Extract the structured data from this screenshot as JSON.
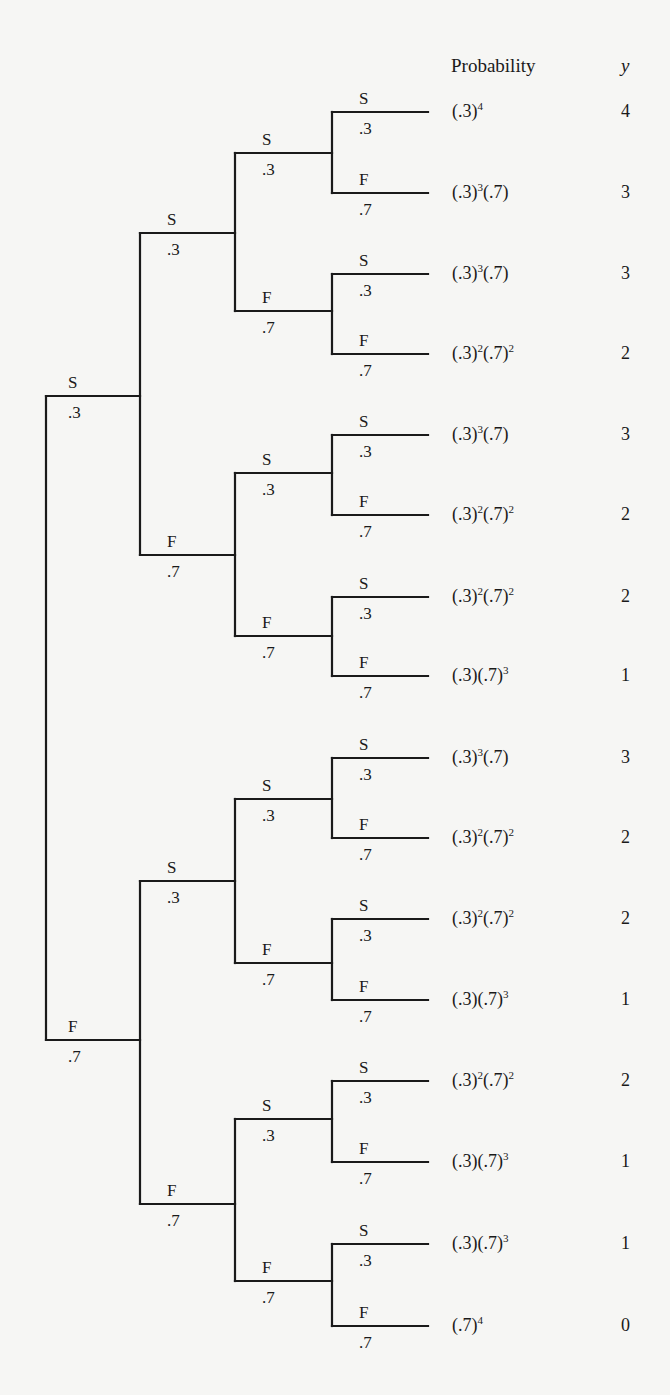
{
  "header": {
    "probability_label": "Probability",
    "y_label": "y"
  },
  "tree": {
    "root_x": 46,
    "level_x": [
      46,
      140,
      235,
      332,
      428
    ],
    "line_color": "#1a1a1a",
    "edge_prob_success": ".3",
    "edge_prob_failure": ".7",
    "outcome_success": "S",
    "outcome_failure": "F"
  },
  "nodes": {
    "level1": [
      {
        "outcome": "S",
        "prob": ".3",
        "y": 396
      },
      {
        "outcome": "F",
        "prob": ".7",
        "y": 1040
      }
    ],
    "level2": [
      {
        "outcome": "S",
        "prob": ".3",
        "y": 233
      },
      {
        "outcome": "F",
        "prob": ".7",
        "y": 555
      },
      {
        "outcome": "S",
        "prob": ".3",
        "y": 881
      },
      {
        "outcome": "F",
        "prob": ".7",
        "y": 1204
      }
    ],
    "level3": [
      {
        "outcome": "S",
        "prob": ".3",
        "y": 153
      },
      {
        "outcome": "F",
        "prob": ".7",
        "y": 311
      },
      {
        "outcome": "S",
        "prob": ".3",
        "y": 473
      },
      {
        "outcome": "F",
        "prob": ".7",
        "y": 636
      },
      {
        "outcome": "S",
        "prob": ".3",
        "y": 799
      },
      {
        "outcome": "F",
        "prob": ".7",
        "y": 963
      },
      {
        "outcome": "S",
        "prob": ".3",
        "y": 1119
      },
      {
        "outcome": "F",
        "prob": ".7",
        "y": 1281
      }
    ]
  },
  "leaves": [
    {
      "outcome": "S",
      "prob": ".3",
      "y": 112,
      "probability": [
        [
          "(.3)",
          "4"
        ]
      ],
      "y_value": "4"
    },
    {
      "outcome": "F",
      "prob": ".7",
      "y": 193,
      "probability": [
        [
          "(.3)",
          "3"
        ],
        [
          "(.7)",
          ""
        ]
      ],
      "y_value": "3"
    },
    {
      "outcome": "S",
      "prob": ".3",
      "y": 274,
      "probability": [
        [
          "(.3)",
          "3"
        ],
        [
          "(.7)",
          ""
        ]
      ],
      "y_value": "3"
    },
    {
      "outcome": "F",
      "prob": ".7",
      "y": 354,
      "probability": [
        [
          "(.3)",
          "2"
        ],
        [
          "(.7)",
          "2"
        ]
      ],
      "y_value": "2"
    },
    {
      "outcome": "S",
      "prob": ".3",
      "y": 435,
      "probability": [
        [
          "(.3)",
          "3"
        ],
        [
          "(.7)",
          ""
        ]
      ],
      "y_value": "3"
    },
    {
      "outcome": "F",
      "prob": ".7",
      "y": 515,
      "probability": [
        [
          "(.3)",
          "2"
        ],
        [
          "(.7)",
          "2"
        ]
      ],
      "y_value": "2"
    },
    {
      "outcome": "S",
      "prob": ".3",
      "y": 597,
      "probability": [
        [
          "(.3)",
          "2"
        ],
        [
          "(.7)",
          "2"
        ]
      ],
      "y_value": "2"
    },
    {
      "outcome": "F",
      "prob": ".7",
      "y": 676,
      "probability": [
        [
          "(.3)",
          ""
        ],
        [
          "(.7)",
          "3"
        ]
      ],
      "y_value": "1"
    },
    {
      "outcome": "S",
      "prob": ".3",
      "y": 758,
      "probability": [
        [
          "(.3)",
          "3"
        ],
        [
          "(.7)",
          ""
        ]
      ],
      "y_value": "3"
    },
    {
      "outcome": "F",
      "prob": ".7",
      "y": 838,
      "probability": [
        [
          "(.3)",
          "2"
        ],
        [
          "(.7)",
          "2"
        ]
      ],
      "y_value": "2"
    },
    {
      "outcome": "S",
      "prob": ".3",
      "y": 919,
      "probability": [
        [
          "(.3)",
          "2"
        ],
        [
          "(.7)",
          "2"
        ]
      ],
      "y_value": "2"
    },
    {
      "outcome": "F",
      "prob": ".7",
      "y": 1000,
      "probability": [
        [
          "(.3)",
          ""
        ],
        [
          "(.7)",
          "3"
        ]
      ],
      "y_value": "1"
    },
    {
      "outcome": "S",
      "prob": ".3",
      "y": 1081,
      "probability": [
        [
          "(.3)",
          "2"
        ],
        [
          "(.7)",
          "2"
        ]
      ],
      "y_value": "2"
    },
    {
      "outcome": "F",
      "prob": ".7",
      "y": 1162,
      "probability": [
        [
          "(.3)",
          ""
        ],
        [
          "(.7)",
          "3"
        ]
      ],
      "y_value": "1"
    },
    {
      "outcome": "S",
      "prob": ".3",
      "y": 1244,
      "probability": [
        [
          "(.3)",
          ""
        ],
        [
          "(.7)",
          "3"
        ]
      ],
      "y_value": "1"
    },
    {
      "outcome": "F",
      "prob": ".7",
      "y": 1326,
      "probability": [
        [
          "(.7)",
          "4"
        ]
      ],
      "y_value": "0"
    }
  ]
}
